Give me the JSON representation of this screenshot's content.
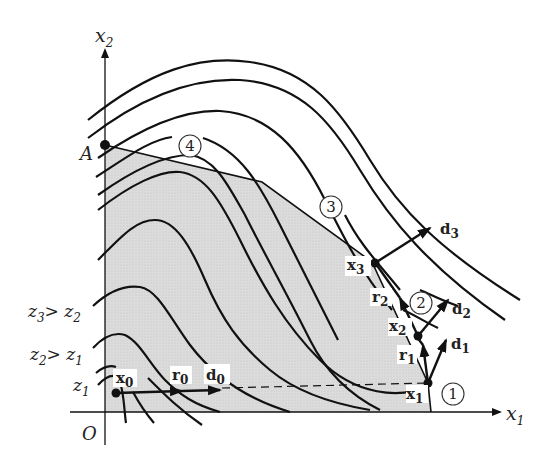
{
  "diagram": {
    "type": "optimization-contour-diagram",
    "axes": {
      "x_label": "x",
      "x_sub": "1",
      "y_label": "x",
      "y_sub": "2",
      "origin_label": "O"
    },
    "vertex_label": "A",
    "contour_labels": [
      {
        "main": "z",
        "sub": "1",
        "rest": ""
      },
      {
        "main": "z",
        "sub": "2",
        "rest": "> z",
        "rest_sub": "1"
      },
      {
        "main": "z",
        "sub": "3",
        "rest": "> z",
        "rest_sub": "2"
      }
    ],
    "points": [
      {
        "name": "x",
        "sub": "0"
      },
      {
        "name": "x",
        "sub": "1"
      },
      {
        "name": "x",
        "sub": "2"
      },
      {
        "name": "x",
        "sub": "3"
      }
    ],
    "vectors": [
      {
        "name": "r",
        "sub": "0"
      },
      {
        "name": "d",
        "sub": "0"
      },
      {
        "name": "r",
        "sub": "1"
      },
      {
        "name": "d",
        "sub": "1"
      },
      {
        "name": "r",
        "sub": "2"
      },
      {
        "name": "d",
        "sub": "2"
      },
      {
        "name": "d",
        "sub": "3"
      }
    ],
    "circled_numbers": [
      "1",
      "2",
      "3",
      "4"
    ],
    "colors": {
      "feasible_region": "#d9d9d9",
      "lines": "#111111",
      "background": "#ffffff"
    }
  }
}
